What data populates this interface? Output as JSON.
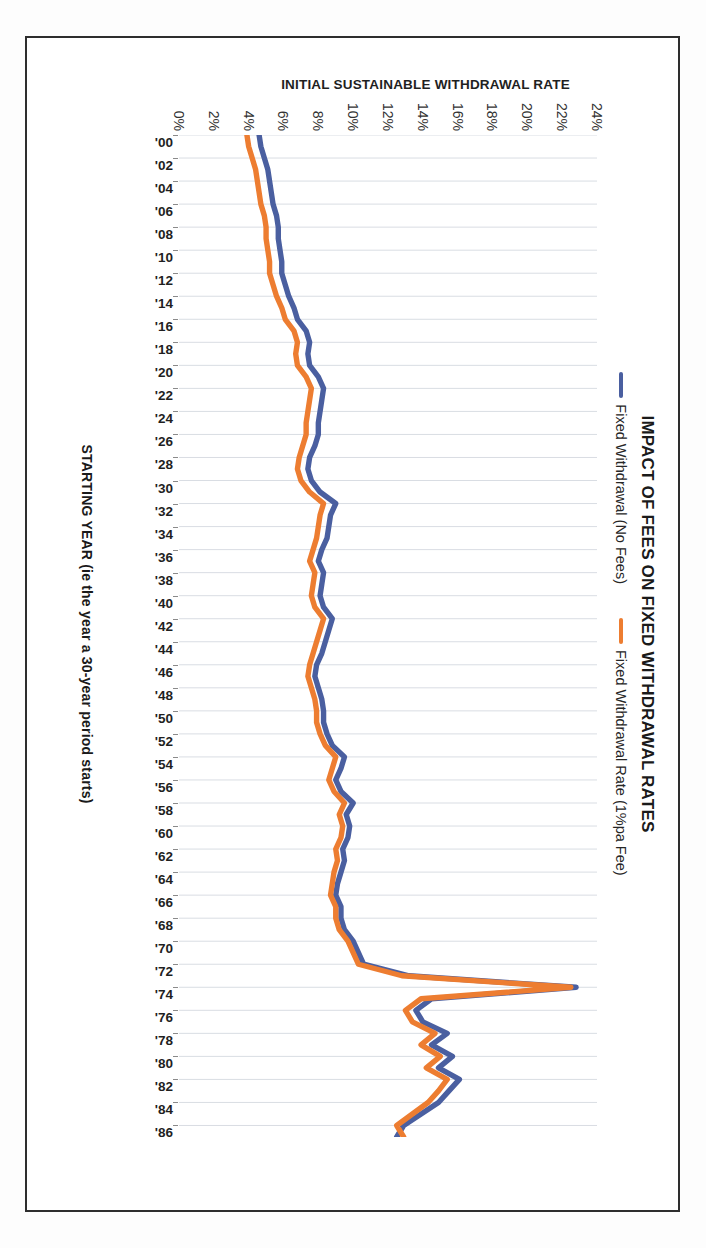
{
  "chart_data": {
    "type": "line",
    "title": "IMPACT OF FEES ON FIXED WITHDRAWAL RATES",
    "xlabel": "STARTING YEAR (ie the year a 30-year period starts)",
    "ylabel": "INITIAL SUSTAINABLE WITHDRAWAL RATE",
    "grid": "vertical-only",
    "legend_position": "top-center",
    "ylim": [
      0,
      24
    ],
    "y_tick_labels": [
      "24%",
      "22%",
      "20%",
      "18%",
      "16%",
      "14%",
      "12%",
      "10%",
      "8%",
      "6%",
      "4%",
      "2%",
      "0%"
    ],
    "y_tick_values": [
      24,
      22,
      20,
      18,
      16,
      14,
      12,
      10,
      8,
      6,
      4,
      2,
      0
    ],
    "x_tick_labels": [
      "'00",
      "'02",
      "'04",
      "'06",
      "'08",
      "'10",
      "'12",
      "'14",
      "'16",
      "'18",
      "'20",
      "'22",
      "'24",
      "'26",
      "'28",
      "'30",
      "'32",
      "'34",
      "'36",
      "'38",
      "'40",
      "'42",
      "'44",
      "'46",
      "'48",
      "'50",
      "'52",
      "'54",
      "'56",
      "'58",
      "'60",
      "'62",
      "'64",
      "'66",
      "'68",
      "'70",
      "'72",
      "'74",
      "'76",
      "'78",
      "'80",
      "'82",
      "'84",
      "'86"
    ],
    "colors": {
      "series_no_fees": "#4A5FA0",
      "series_fee": "#ED7D31",
      "gridline": "#d9dde3",
      "axis_text": "#1f1f1f",
      "frame": "#2e2e2e"
    },
    "x": [
      1900,
      1901,
      1902,
      1903,
      1904,
      1905,
      1906,
      1907,
      1908,
      1909,
      1910,
      1911,
      1912,
      1913,
      1914,
      1915,
      1916,
      1917,
      1918,
      1919,
      1920,
      1921,
      1922,
      1923,
      1924,
      1925,
      1926,
      1927,
      1928,
      1929,
      1930,
      1931,
      1932,
      1933,
      1934,
      1935,
      1936,
      1937,
      1938,
      1939,
      1940,
      1941,
      1942,
      1943,
      1944,
      1945,
      1946,
      1947,
      1948,
      1949,
      1950,
      1951,
      1952,
      1953,
      1954,
      1955,
      1956,
      1957,
      1958,
      1959,
      1960,
      1961,
      1962,
      1963,
      1964,
      1965,
      1966,
      1967,
      1968,
      1969,
      1970,
      1971,
      1972,
      1973,
      1974,
      1975,
      1976,
      1977,
      1978,
      1979,
      1980,
      1981,
      1982,
      1983,
      1984,
      1985,
      1986,
      1987
    ],
    "series": [
      {
        "name": "Fixed Withdrawal (No Fees)",
        "color": "#4A5FA0",
        "values": [
          4.6,
          4.7,
          4.9,
          5.1,
          5.2,
          5.3,
          5.4,
          5.6,
          5.7,
          5.7,
          5.8,
          5.9,
          5.9,
          6.1,
          6.3,
          6.6,
          6.8,
          7.3,
          7.5,
          7.4,
          7.5,
          8.0,
          8.3,
          8.2,
          8.1,
          8.0,
          8.0,
          7.8,
          7.5,
          7.4,
          7.6,
          8.1,
          9.0,
          8.7,
          8.6,
          8.5,
          8.2,
          8.0,
          8.3,
          8.2,
          8.1,
          8.3,
          8.8,
          8.6,
          8.4,
          8.2,
          7.9,
          7.8,
          8.0,
          8.2,
          8.3,
          8.3,
          8.5,
          8.8,
          9.5,
          9.3,
          9.0,
          9.3,
          10.0,
          9.6,
          9.8,
          9.7,
          9.4,
          9.5,
          9.3,
          9.1,
          9.0,
          9.3,
          9.3,
          9.5,
          10.0,
          10.3,
          10.6,
          13.2,
          22.8,
          14.5,
          13.6,
          14.0,
          15.4,
          14.5,
          15.7,
          14.9,
          16.1,
          15.5,
          14.9,
          13.9,
          12.9,
          12.5
        ]
      },
      {
        "name": "Fixed Withdrawal Rate (1%pa Fee)",
        "color": "#ED7D31",
        "values": [
          3.9,
          4.0,
          4.2,
          4.4,
          4.5,
          4.6,
          4.7,
          4.9,
          5.0,
          5.0,
          5.1,
          5.2,
          5.2,
          5.4,
          5.6,
          5.9,
          6.1,
          6.6,
          6.8,
          6.7,
          6.8,
          7.3,
          7.6,
          7.5,
          7.4,
          7.3,
          7.3,
          7.1,
          6.9,
          6.8,
          7.0,
          7.5,
          8.3,
          8.1,
          8.0,
          7.9,
          7.7,
          7.5,
          7.8,
          7.7,
          7.6,
          7.8,
          8.3,
          8.1,
          7.9,
          7.7,
          7.5,
          7.4,
          7.6,
          7.8,
          7.9,
          7.9,
          8.1,
          8.4,
          9.0,
          8.8,
          8.6,
          8.9,
          9.5,
          9.2,
          9.4,
          9.3,
          9.0,
          9.1,
          8.9,
          8.8,
          8.7,
          9.0,
          9.0,
          9.2,
          9.7,
          10.0,
          10.3,
          12.8,
          22.5,
          13.9,
          13.0,
          13.4,
          14.7,
          13.9,
          15.0,
          14.2,
          15.4,
          14.9,
          14.3,
          13.4,
          12.5,
          12.9
        ]
      }
    ]
  },
  "title": {
    "text": "IMPACT OF FEES ON FIXED WITHDRAWAL RATES"
  },
  "legend": {
    "entries": [
      {
        "label": "Fixed Withdrawal (No Fees)",
        "color": "#4A5FA0"
      },
      {
        "label": "Fixed Withdrawal Rate (1%pa Fee)",
        "color": "#ED7D31"
      }
    ]
  },
  "axes": {
    "y_title": "INITIAL SUSTAINABLE WITHDRAWAL RATE",
    "x_title": "STARTING YEAR (ie the year a 30-year period starts)"
  }
}
